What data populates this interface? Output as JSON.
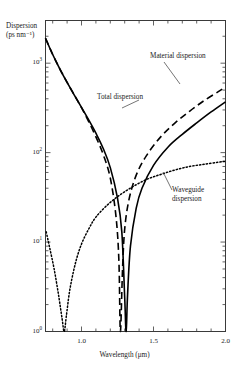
{
  "chart_data": {
    "type": "line",
    "title": "",
    "xlabel": "Wavelength (μm)",
    "ylabel_line1": "Dispersion",
    "ylabel_line2": "(ps nm⁻¹)",
    "xlim": [
      0.75,
      2.0
    ],
    "ylim": [
      1,
      3000
    ],
    "yscale": "log",
    "xscale": "linear",
    "grid": false,
    "legend_position": "inline-annotations",
    "xticks": [
      0.8,
      0.9,
      1.0,
      1.1,
      1.2,
      1.3,
      1.4,
      1.5,
      1.6,
      1.7,
      1.8,
      1.9,
      2.0
    ],
    "xticklabels": [
      "",
      "",
      "1.0",
      "",
      "",
      "",
      "",
      "1.5",
      "",
      "",
      "",
      "",
      "2.0"
    ],
    "yticks": [
      1,
      10,
      100,
      1000
    ],
    "yticklabels": [
      "10⁰",
      "10¹",
      "10²",
      "10³"
    ],
    "annotations": [
      {
        "text": "Material dispersion",
        "x": 1.62,
        "y": 760
      },
      {
        "text": "Total dispersion",
        "x": 1.28,
        "y": 250
      },
      {
        "text": "Waveguide dispersion",
        "x": 1.78,
        "y": 21
      }
    ],
    "series": [
      {
        "name": "Total dispersion",
        "style": "solid",
        "color": "#000000",
        "zero_crossing": 1.31,
        "points": [
          [
            0.75,
            1900
          ],
          [
            0.8,
            1250
          ],
          [
            0.85,
            860
          ],
          [
            0.9,
            610
          ],
          [
            0.95,
            440
          ],
          [
            1.0,
            320
          ],
          [
            1.05,
            232
          ],
          [
            1.1,
            165
          ],
          [
            1.15,
            112
          ],
          [
            1.2,
            68
          ],
          [
            1.25,
            31
          ],
          [
            1.28,
            13
          ],
          [
            1.3,
            2.4
          ],
          [
            1.31,
            1.0
          ],
          [
            1.32,
            2.6
          ],
          [
            1.34,
            9
          ],
          [
            1.38,
            24
          ],
          [
            1.42,
            40
          ],
          [
            1.5,
            72
          ],
          [
            1.6,
            115
          ],
          [
            1.7,
            160
          ],
          [
            1.8,
            215
          ],
          [
            1.9,
            285
          ],
          [
            2.0,
            370
          ]
        ]
      },
      {
        "name": "Material dispersion",
        "style": "dashed",
        "color": "#000000",
        "zero_crossing": 1.27,
        "points": [
          [
            0.75,
            1900
          ],
          [
            0.8,
            1250
          ],
          [
            0.85,
            860
          ],
          [
            0.9,
            610
          ],
          [
            0.95,
            440
          ],
          [
            1.0,
            318
          ],
          [
            1.05,
            222
          ],
          [
            1.1,
            150
          ],
          [
            1.15,
            96
          ],
          [
            1.2,
            52
          ],
          [
            1.24,
            19
          ],
          [
            1.26,
            6
          ],
          [
            1.27,
            1.0
          ],
          [
            1.285,
            5
          ],
          [
            1.3,
            14
          ],
          [
            1.33,
            30
          ],
          [
            1.38,
            56
          ],
          [
            1.45,
            92
          ],
          [
            1.55,
            150
          ],
          [
            1.65,
            215
          ],
          [
            1.75,
            290
          ],
          [
            1.85,
            380
          ],
          [
            1.95,
            480
          ],
          [
            2.0,
            540
          ]
        ]
      },
      {
        "name": "Waveguide dispersion",
        "style": "dotted",
        "color": "#000000",
        "zero_crossing": 0.88,
        "points": [
          [
            0.755,
            13
          ],
          [
            0.78,
            8.5
          ],
          [
            0.81,
            5.0
          ],
          [
            0.84,
            2.6
          ],
          [
            0.865,
            1.4
          ],
          [
            0.88,
            1.0
          ],
          [
            0.895,
            1.5
          ],
          [
            0.92,
            3.0
          ],
          [
            0.96,
            6.0
          ],
          [
            1.0,
            9.5
          ],
          [
            1.05,
            14
          ],
          [
            1.1,
            19
          ],
          [
            1.18,
            26
          ],
          [
            1.26,
            33
          ],
          [
            1.35,
            41
          ],
          [
            1.45,
            50
          ],
          [
            1.55,
            57
          ],
          [
            1.65,
            64
          ],
          [
            1.75,
            70
          ],
          [
            1.85,
            74
          ],
          [
            1.95,
            78
          ],
          [
            2.0,
            80
          ]
        ]
      }
    ]
  }
}
